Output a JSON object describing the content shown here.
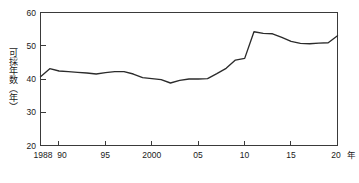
{
  "chart_data": {
    "type": "line",
    "title": "",
    "subtitle": "",
    "xlabel": "年",
    "ylabel": "可採年数（年）",
    "xlim": [
      1988,
      2020
    ],
    "ylim": [
      20,
      60
    ],
    "grid": false,
    "legend": null,
    "legend_position": "none",
    "y_ticks": [
      20,
      30,
      40,
      50,
      60
    ],
    "y_tick_labels": [
      "20",
      "30",
      "40",
      "50",
      "60"
    ],
    "x_ticks": [
      1988,
      1990,
      1995,
      2000,
      2005,
      2010,
      2015,
      2020
    ],
    "x_tick_labels": [
      "1988",
      "90",
      "95",
      "2000",
      "05",
      "10",
      "15",
      "20"
    ],
    "x": [
      1988,
      1989,
      1990,
      1991,
      1992,
      1993,
      1994,
      1995,
      1996,
      1997,
      1998,
      1999,
      2000,
      2001,
      2002,
      2003,
      2004,
      2005,
      2006,
      2007,
      2008,
      2009,
      2010,
      2011,
      2012,
      2013,
      2014,
      2015,
      2016,
      2017,
      2018,
      2019,
      2020
    ],
    "series": [
      {
        "name": "可採年数",
        "values": [
          40.7,
          43.1,
          42.4,
          42.2,
          42.0,
          41.8,
          41.5,
          41.9,
          42.2,
          42.2,
          41.5,
          40.4,
          40.1,
          39.8,
          38.8,
          39.6,
          40.0,
          40.0,
          40.1,
          41.6,
          43.2,
          45.7,
          46.2,
          54.2,
          53.7,
          53.6,
          52.5,
          51.3,
          50.7,
          50.6,
          50.8,
          50.9,
          53.0
        ]
      }
    ]
  },
  "axis": {
    "y_unit_in_label": "（年）",
    "x_unit": "年"
  }
}
